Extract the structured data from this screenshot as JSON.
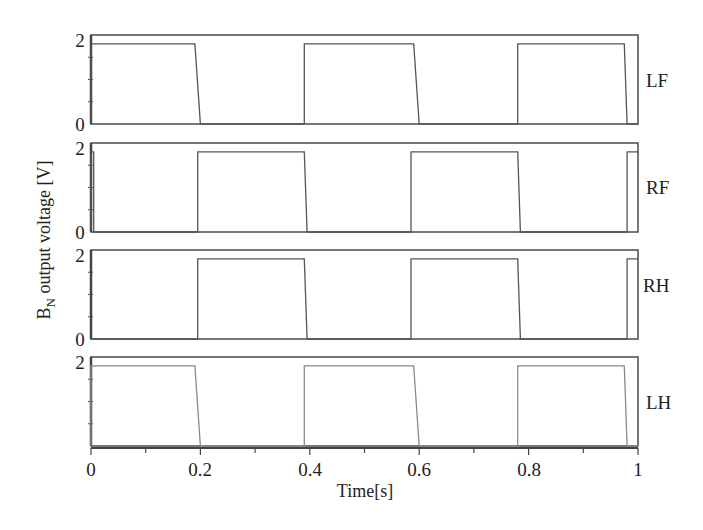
{
  "chart_data": {
    "type": "line",
    "title": "",
    "xlabel": "Time[s]",
    "ylabel": "B_N output voltage [V]",
    "ylabel_main": "B",
    "ylabel_sub": "N",
    "ylabel_rest": " output voltage [V]",
    "xlim": [
      0,
      1
    ],
    "ylim": [
      0,
      2
    ],
    "x_ticks": [
      "0",
      "0.2",
      "0.4",
      "0.6",
      "0.8",
      "1"
    ],
    "grid": false,
    "legend_position": "right of each panel",
    "panels": [
      {
        "name": "LF",
        "y_ticks": [
          "2",
          "0"
        ],
        "high_level": 1.8,
        "segments": [
          {
            "x": [
              0.0,
              0.0,
              0.19,
              0.2,
              0.39,
              0.39,
              0.59,
              0.6,
              0.78,
              0.78,
              0.975,
              0.98,
              1.0
            ],
            "y": [
              0,
              1.8,
              1.8,
              0,
              0,
              1.8,
              1.8,
              0,
              0,
              1.8,
              1.8,
              0,
              0
            ]
          }
        ]
      },
      {
        "name": "RF",
        "y_ticks": [
          "2",
          "0"
        ],
        "high_level": 1.8,
        "segments": [
          {
            "x": [
              0.0,
              0.0,
              0.005,
              0.005,
              0.195,
              0.195,
              0.39,
              0.395,
              0.585,
              0.585,
              0.78,
              0.785,
              0.98,
              0.98,
              1.0
            ],
            "y": [
              0,
              1.8,
              1.8,
              0,
              0,
              1.8,
              1.8,
              0,
              0,
              1.8,
              1.8,
              0,
              0,
              1.8,
              1.8
            ]
          }
        ]
      },
      {
        "name": "RH",
        "y_ticks": [
          "2",
          "0"
        ],
        "high_level": 1.8,
        "segments": [
          {
            "x": [
              0.0,
              0.195,
              0.195,
              0.39,
              0.395,
              0.585,
              0.585,
              0.78,
              0.785,
              0.98,
              0.98,
              1.0
            ],
            "y": [
              0,
              0,
              1.8,
              1.8,
              0,
              0,
              1.8,
              1.8,
              0,
              0,
              1.8,
              1.8
            ]
          }
        ]
      },
      {
        "name": "LH",
        "y_ticks": [
          "2"
        ],
        "high_level": 1.8,
        "segments": [
          {
            "x": [
              0.0,
              0.0,
              0.19,
              0.2,
              0.39,
              0.39,
              0.59,
              0.6,
              0.78,
              0.78,
              0.975,
              0.98,
              1.0
            ],
            "y": [
              0,
              1.8,
              1.8,
              0,
              0,
              1.8,
              1.8,
              0,
              0,
              1.8,
              1.8,
              0,
              0
            ]
          }
        ]
      }
    ]
  },
  "labels": {
    "panel_LF": "LF",
    "panel_RF": "RF",
    "panel_RH": "RH",
    "panel_LH": "LH",
    "x_title": "Time[s]",
    "y_title_B": "B",
    "y_title_N": "N",
    "y_title_rest": " output voltage [V]",
    "x0": "0",
    "x1": "0.2",
    "x2": "0.4",
    "x3": "0.6",
    "x4": "0.8",
    "x5": "1",
    "y_top": "2",
    "y_zero": "0"
  }
}
